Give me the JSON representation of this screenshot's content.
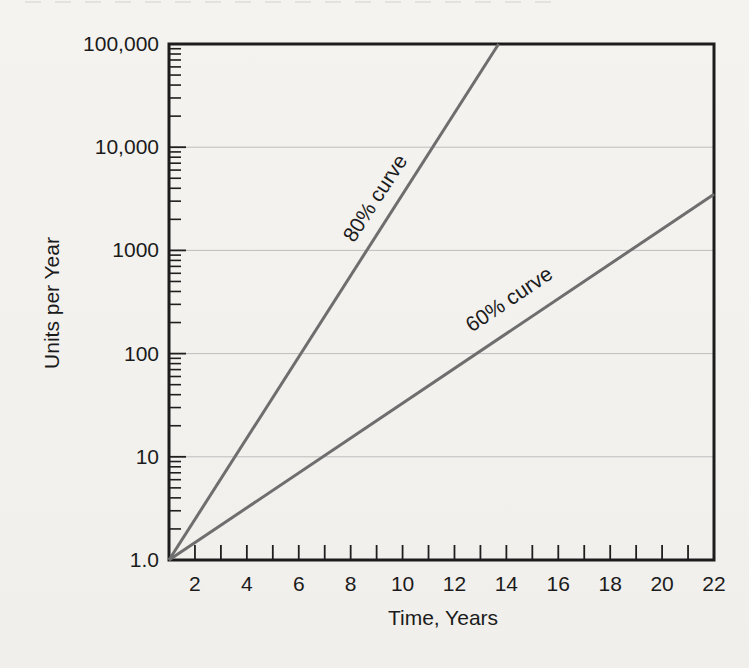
{
  "figure": {
    "background_color": "#f3f2ef",
    "axis_color": "#1c1c1c",
    "tick_color": "#1f1f1f",
    "grid_color": "#bdbdbd",
    "curve_color": "#6e6e6e",
    "text_color": "#1b1b1b"
  },
  "chart_data": {
    "type": "line",
    "title": "",
    "xlabel": "Time, Years",
    "ylabel": "Units per Year",
    "x_axis": {
      "scale": "linear",
      "min": 1,
      "max": 22,
      "minor_tick_step": 1,
      "labeled_ticks": [
        2,
        4,
        6,
        8,
        10,
        12,
        14,
        16,
        18,
        20,
        22
      ],
      "tick_labels": [
        "2",
        "4",
        "6",
        "8",
        "10",
        "12",
        "14",
        "16",
        "18",
        "20",
        "22"
      ]
    },
    "y_axis": {
      "scale": "log",
      "min": 1,
      "max": 100000,
      "decade_values": [
        1,
        10,
        100,
        1000,
        10000,
        100000
      ],
      "tick_labels": [
        "1.0",
        "10",
        "100",
        "1000",
        "10,000",
        "100,000"
      ],
      "minor_ticks_per_decade": [
        2,
        3,
        4,
        5,
        6,
        7,
        8,
        9
      ]
    },
    "grid": "horizontal gridlines at each decade, no vertical gridlines",
    "legend": "inline rotated labels along each line",
    "series": [
      {
        "name": "80% curve",
        "points": [
          {
            "x": 1,
            "y": 1.0
          },
          {
            "x": 13.7,
            "y": 100000
          }
        ]
      },
      {
        "name": "60% curve",
        "points": [
          {
            "x": 1,
            "y": 1.0
          },
          {
            "x": 22,
            "y": 3500
          }
        ]
      }
    ]
  }
}
